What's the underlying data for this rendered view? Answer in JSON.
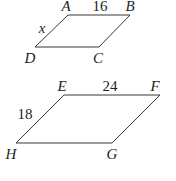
{
  "diagram": {
    "parallelograms": [
      {
        "name": "ABCD",
        "vertices": [
          {
            "label": "A",
            "x": 68,
            "y": 15,
            "lx": 66,
            "ly": 11
          },
          {
            "label": "B",
            "x": 130,
            "y": 15,
            "lx": 130,
            "ly": 11
          },
          {
            "label": "C",
            "x": 99,
            "y": 47,
            "lx": 98,
            "ly": 63
          },
          {
            "label": "D",
            "x": 35,
            "y": 47,
            "lx": 30,
            "ly": 63
          }
        ],
        "side_labels": [
          {
            "side": "AB",
            "text": "16",
            "x": 100,
            "y": 11,
            "italic": false
          },
          {
            "side": "AD",
            "text": "x",
            "x": 42,
            "y": 33,
            "italic": true
          }
        ]
      },
      {
        "name": "EFGH",
        "vertices": [
          {
            "label": "E",
            "x": 64,
            "y": 95,
            "lx": 62,
            "ly": 91
          },
          {
            "label": "F",
            "x": 160,
            "y": 95,
            "lx": 155,
            "ly": 91
          },
          {
            "label": "G",
            "x": 112,
            "y": 143,
            "lx": 112,
            "ly": 159
          },
          {
            "label": "H",
            "x": 16,
            "y": 143,
            "lx": 11,
            "ly": 159
          }
        ],
        "side_labels": [
          {
            "side": "EF",
            "text": "24",
            "x": 110,
            "y": 91,
            "italic": false
          },
          {
            "side": "EH",
            "text": "18",
            "x": 25,
            "y": 119,
            "italic": false
          }
        ]
      }
    ],
    "colors": {
      "line": "#3a3637",
      "text": "#231f20",
      "background": "#ffffff"
    }
  }
}
